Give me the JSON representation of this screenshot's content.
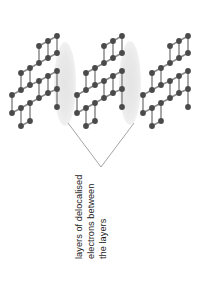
{
  "diagram": {
    "background_color": "#ffffff",
    "atom_color": "#4a4a4a",
    "bond_color": "#8a8a8a",
    "electron_cloud_color": "#e8e8e8",
    "leader_line_color": "#9a9a9a",
    "text_color": "#1d1d1d"
  },
  "annotation": {
    "lines": [
      "layers of delocalised",
      "electrons between",
      "the layers"
    ],
    "full_text": "layers of delocalised electrons between the layers",
    "rotation_degrees": -90
  },
  "electron_clouds": [
    {
      "label": "delocalised-electron-cloud-left",
      "cx": 65,
      "cy": 84,
      "rx": 11,
      "ry": 42
    },
    {
      "label": "delocalised-electron-cloud-right",
      "cx": 130,
      "cy": 83,
      "rx": 11,
      "ry": 42
    }
  ],
  "leader_lines": [
    {
      "label": "leader-line-left",
      "x1": 68,
      "y1": 123,
      "x2": 101,
      "y2": 167
    },
    {
      "label": "leader-line-right",
      "x1": 134,
      "y1": 123,
      "x2": 101,
      "y2": 167
    }
  ],
  "layers": [
    {
      "label": "graphite-layer-left",
      "offset_x": 0
    },
    {
      "label": "graphite-layer-middle",
      "offset_x": 65
    },
    {
      "label": "graphite-layer-right",
      "offset_x": 131
    }
  ],
  "lattice": {
    "atom_radius": 2.9,
    "bond_width": 1.5,
    "atoms": [
      [
        12,
        95
      ],
      [
        12,
        113
      ],
      [
        21,
        73
      ],
      [
        21,
        90
      ],
      [
        21,
        108
      ],
      [
        21,
        126
      ],
      [
        30,
        68
      ],
      [
        30,
        85
      ],
      [
        30,
        103
      ],
      [
        30,
        121
      ],
      [
        39,
        46
      ],
      [
        39,
        63
      ],
      [
        39,
        81
      ],
      [
        39,
        98
      ],
      [
        48,
        41
      ],
      [
        48,
        58
      ],
      [
        48,
        76
      ],
      [
        48,
        93
      ],
      [
        57,
        36
      ],
      [
        57,
        53
      ],
      [
        57,
        71
      ],
      [
        57,
        89
      ],
      [
        57,
        107
      ]
    ],
    "bonds": [
      [
        [
          12,
          95
        ],
        [
          21,
          90
        ]
      ],
      [
        [
          12,
          95
        ],
        [
          12,
          113
        ]
      ],
      [
        [
          12,
          113
        ],
        [
          21,
          108
        ]
      ],
      [
        [
          21,
          73
        ],
        [
          30,
          68
        ]
      ],
      [
        [
          21,
          73
        ],
        [
          21,
          90
        ]
      ],
      [
        [
          21,
          90
        ],
        [
          30,
          85
        ]
      ],
      [
        [
          21,
          108
        ],
        [
          30,
          103
        ]
      ],
      [
        [
          21,
          108
        ],
        [
          21,
          126
        ]
      ],
      [
        [
          21,
          126
        ],
        [
          30,
          121
        ]
      ],
      [
        [
          30,
          68
        ],
        [
          39,
          63
        ]
      ],
      [
        [
          30,
          68
        ],
        [
          30,
          85
        ]
      ],
      [
        [
          30,
          85
        ],
        [
          39,
          81
        ]
      ],
      [
        [
          30,
          103
        ],
        [
          39,
          98
        ]
      ],
      [
        [
          30,
          103
        ],
        [
          30,
          121
        ]
      ],
      [
        [
          39,
          46
        ],
        [
          48,
          41
        ]
      ],
      [
        [
          39,
          46
        ],
        [
          39,
          63
        ]
      ],
      [
        [
          39,
          63
        ],
        [
          48,
          58
        ]
      ],
      [
        [
          39,
          81
        ],
        [
          48,
          76
        ]
      ],
      [
        [
          39,
          81
        ],
        [
          39,
          98
        ]
      ],
      [
        [
          39,
          98
        ],
        [
          48,
          93
        ]
      ],
      [
        [
          48,
          41
        ],
        [
          57,
          36
        ]
      ],
      [
        [
          48,
          41
        ],
        [
          48,
          58
        ]
      ],
      [
        [
          48,
          58
        ],
        [
          57,
          53
        ]
      ],
      [
        [
          48,
          76
        ],
        [
          57,
          71
        ]
      ],
      [
        [
          48,
          76
        ],
        [
          48,
          93
        ]
      ],
      [
        [
          48,
          93
        ],
        [
          57,
          89
        ]
      ],
      [
        [
          57,
          36
        ],
        [
          57,
          53
        ]
      ],
      [
        [
          57,
          71
        ],
        [
          57,
          89
        ]
      ],
      [
        [
          57,
          89
        ],
        [
          57,
          107
        ]
      ]
    ]
  }
}
